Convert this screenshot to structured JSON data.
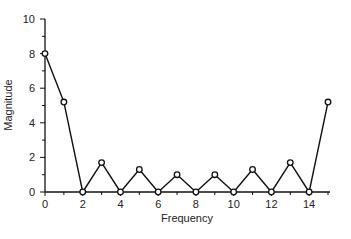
{
  "chart_data": {
    "type": "line",
    "title": "",
    "xlabel": "Frequency",
    "ylabel": "Magnitude",
    "x": [
      0,
      1,
      2,
      3,
      4,
      5,
      6,
      7,
      8,
      9,
      10,
      11,
      12,
      13,
      14,
      15
    ],
    "values": [
      8,
      5.2,
      0,
      1.7,
      0,
      1.3,
      0,
      1.0,
      0,
      1.0,
      0,
      1.3,
      0,
      1.7,
      0,
      5.2
    ],
    "xlim": [
      0,
      15
    ],
    "ylim": [
      0,
      10
    ],
    "xticks": [
      0,
      2,
      4,
      6,
      8,
      10,
      12,
      14
    ],
    "yticks": [
      0,
      2,
      4,
      6,
      8,
      10
    ],
    "xminor_ticks": [
      1,
      3,
      5,
      7,
      9,
      11,
      13,
      15
    ],
    "yminor_ticks": [
      1,
      3,
      5,
      7,
      9
    ],
    "marker": "open-circle",
    "grid": false,
    "legend": null,
    "line_color": "#111111"
  }
}
